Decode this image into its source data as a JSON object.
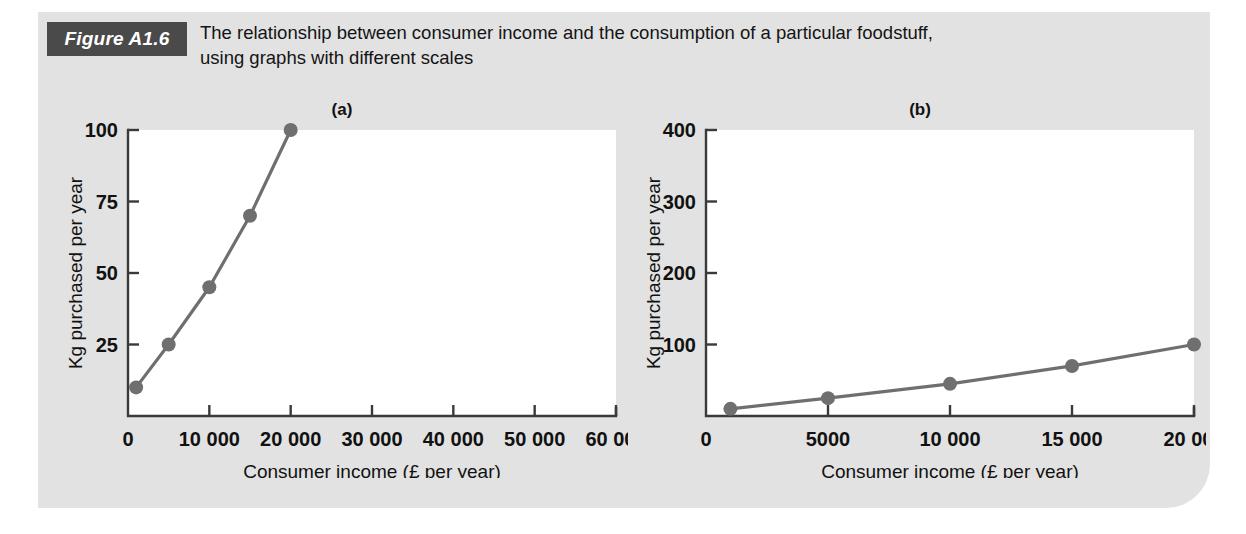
{
  "figure": {
    "badge_label": "Figure A1.6",
    "caption_line_1": "The relationship between consumer income and the consumption of a particular foodstuff,",
    "caption_line_2": "using graphs with different scales",
    "panel_color": "#e2e2e2",
    "badge_color": "#4a4a4a",
    "badge_text_color": "#ffffff"
  },
  "chart_data": [
    {
      "id": "a",
      "type": "line",
      "title": "(a)",
      "xlabel": "Consumer income (£ per year)",
      "ylabel": "Kg purchased per year",
      "xlim": [
        0,
        60000
      ],
      "ylim": [
        0,
        100
      ],
      "grid": false,
      "legend": "none",
      "series_color": "#6f6f6f",
      "plot_bg": "#ffffff",
      "xticks": [
        0,
        10000,
        20000,
        30000,
        40000,
        50000,
        60000
      ],
      "xticklabels": [
        "0",
        "10 000",
        "20 000",
        "30 000",
        "40 000",
        "50 000",
        "60 000"
      ],
      "yticks": [
        25,
        50,
        75,
        100
      ],
      "yticklabels": [
        "25",
        "50",
        "75",
        "100"
      ],
      "x": [
        1000,
        5000,
        10000,
        15000,
        20000
      ],
      "values": [
        10,
        25,
        45,
        70,
        100
      ]
    },
    {
      "id": "b",
      "type": "line",
      "title": "(b)",
      "xlabel": "Consumer income (£ per year)",
      "ylabel": "Kg purchased per year",
      "xlim": [
        0,
        20000
      ],
      "ylim": [
        0,
        400
      ],
      "grid": false,
      "legend": "none",
      "series_color": "#6f6f6f",
      "plot_bg": "#ffffff",
      "xticks": [
        0,
        5000,
        10000,
        15000,
        20000
      ],
      "xticklabels": [
        "0",
        "5000",
        "10 000",
        "15 000",
        "20 000"
      ],
      "yticks": [
        100,
        200,
        300,
        400
      ],
      "yticklabels": [
        "100",
        "200",
        "300",
        "400"
      ],
      "x": [
        1000,
        5000,
        10000,
        15000,
        20000
      ],
      "values": [
        10,
        25,
        45,
        70,
        100
      ]
    }
  ]
}
